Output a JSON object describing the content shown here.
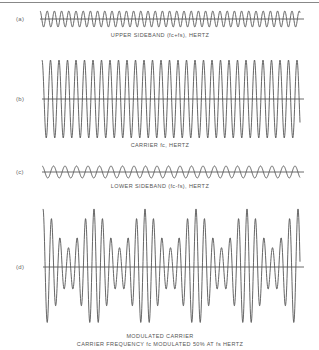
{
  "figure": {
    "panels": [
      {
        "id": "a",
        "label": "(a)",
        "caption": "UPPER SIDEBAND (fc+fs), HERTZ",
        "wave": {
          "type": "sine",
          "x_start": 40,
          "x_end": 300,
          "axis_y": 19,
          "amplitude": 8,
          "period_px": 7.2,
          "axis_end": 304
        }
      },
      {
        "id": "b",
        "label": "(b)",
        "caption": "CARRIER fc, HERTZ",
        "wave": {
          "type": "sine",
          "x_start": 42,
          "x_end": 300,
          "axis_y": 99,
          "amplitude": 39,
          "period_px": 8.5,
          "axis_end": 304
        }
      },
      {
        "id": "c",
        "label": "(c)",
        "caption": "LOWER SIDEBAND (fc-fs), HERTZ",
        "wave": {
          "type": "sine",
          "x_start": 42,
          "x_end": 300,
          "axis_y": 172,
          "amplitude": 6,
          "period_px": 11.5,
          "axis_end": 304
        }
      },
      {
        "id": "d",
        "label": "(d)",
        "caption_line1": "MODULATED CARRIER",
        "caption_line2": "CARRIER FREQUENCY fc MODULATED 50% AT fs HERTZ",
        "wave": {
          "type": "am",
          "x_start": 43,
          "x_end": 300,
          "axis_y": 267,
          "amplitude": 38.7,
          "period_px": 8.5,
          "mod_index": 0.5,
          "envelope_period_px": 51,
          "axis_end": 304
        }
      }
    ],
    "colors": {
      "line": "#555555",
      "axis": "#444444",
      "rule": "#888888"
    }
  }
}
